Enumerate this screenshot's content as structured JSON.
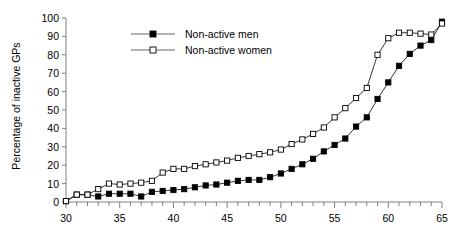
{
  "chart_data": {
    "type": "line",
    "title": "",
    "subtitle": "",
    "xlabel": "",
    "ylabel": "Percentage of inactive GPs",
    "xlim": [
      30,
      65
    ],
    "ylim": [
      0,
      100
    ],
    "xticks": [
      30,
      35,
      40,
      45,
      50,
      55,
      60,
      65
    ],
    "xtick_labels": [
      "30",
      "35",
      "40",
      "45",
      "50",
      "55",
      "60",
      "65"
    ],
    "x_minor_tick_step": 1,
    "yticks": [
      0,
      10,
      20,
      30,
      40,
      50,
      60,
      70,
      80,
      90,
      100
    ],
    "ytick_labels": [
      "0",
      "10",
      "20",
      "30",
      "40",
      "50",
      "60",
      "70",
      "80",
      "90",
      "100"
    ],
    "grid": false,
    "legend_position": "top-center",
    "x": [
      30,
      31,
      32,
      33,
      34,
      35,
      36,
      37,
      38,
      39,
      40,
      41,
      42,
      43,
      44,
      45,
      46,
      47,
      48,
      49,
      50,
      51,
      52,
      53,
      54,
      55,
      56,
      57,
      58,
      59,
      60,
      61,
      62,
      63,
      64,
      65
    ],
    "series": [
      {
        "name": "Non-active men",
        "marker": "filled-square",
        "color": "#000000",
        "values": [
          0.5,
          4.0,
          4.0,
          3.0,
          4.5,
          4.5,
          4.5,
          3.0,
          5.5,
          6.0,
          6.5,
          7.0,
          8.0,
          9.0,
          9.5,
          10.5,
          11.5,
          12.0,
          12.0,
          13.5,
          15.5,
          18.0,
          20.5,
          23.5,
          27.5,
          31.0,
          34.5,
          41.0,
          46.0,
          56.0,
          65.0,
          74.0,
          80.5,
          85.0,
          88.0,
          98.0
        ]
      },
      {
        "name": "Non-active women",
        "marker": "open-square",
        "color": "#000000",
        "values": [
          0.5,
          4.0,
          4.0,
          7.0,
          10.0,
          9.5,
          10.0,
          10.5,
          11.5,
          16.0,
          18.0,
          18.0,
          19.5,
          20.5,
          21.5,
          22.5,
          24.0,
          25.0,
          26.0,
          27.0,
          28.5,
          31.5,
          34.0,
          37.0,
          40.5,
          46.0,
          51.0,
          56.5,
          62.0,
          80.0,
          89.0,
          92.0,
          92.0,
          91.5,
          91.0,
          97.0
        ]
      }
    ]
  },
  "legend": {
    "items": [
      {
        "label": "Non-active men"
      },
      {
        "label": "Non-active women"
      }
    ]
  }
}
